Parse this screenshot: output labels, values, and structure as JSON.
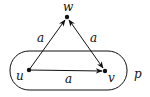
{
  "diagram": {
    "nodes": [
      {
        "id": "w",
        "label": "w",
        "x": 67,
        "y": 17
      },
      {
        "id": "u",
        "label": "u",
        "x": 29,
        "y": 70
      },
      {
        "id": "v",
        "label": "v",
        "x": 105,
        "y": 71
      }
    ],
    "edges": [
      {
        "from": "u",
        "to": "w",
        "label": "a"
      },
      {
        "from": "w",
        "to": "v",
        "label": "a",
        "bidirectional": true
      },
      {
        "from": "u",
        "to": "v",
        "label": "a"
      }
    ],
    "region": {
      "label": "p",
      "contains": [
        "u",
        "v"
      ]
    },
    "colors": {
      "stroke": "#111111",
      "background": "#ffffff"
    }
  }
}
